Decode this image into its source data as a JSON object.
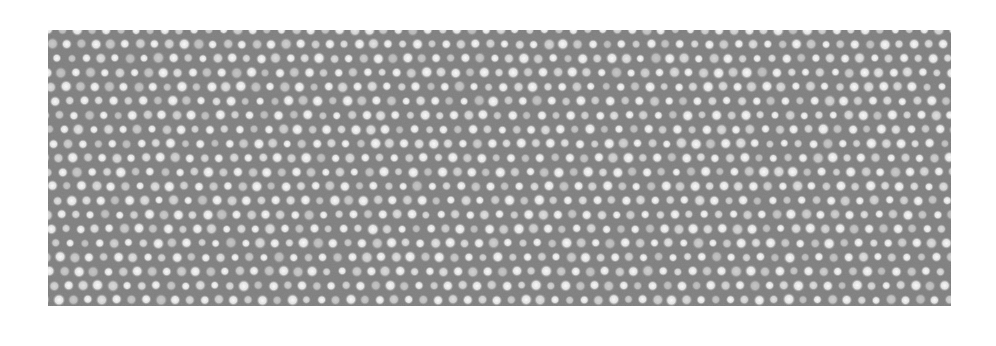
{
  "image": {
    "type": "atomic-resolution micrograph",
    "background_color": "#ffffff",
    "field_color": "#7f7f7f",
    "dot_color": "#ffffff",
    "field": {
      "x": 48,
      "y": 30,
      "width": 903,
      "height": 276
    },
    "lattice": {
      "a": [
        14.6,
        0
      ],
      "b": [
        4.4,
        14.2
      ],
      "dot_radius": 3.6,
      "dim_dot_opacity": 0.55
    }
  }
}
